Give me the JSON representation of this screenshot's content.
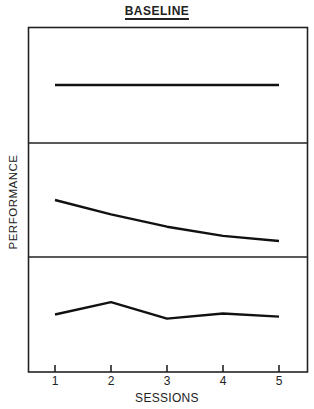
{
  "chart_data": {
    "type": "line",
    "title": "BASELINE",
    "xlabel": "SESSIONS",
    "ylabel": "PERFORMANCE",
    "x": [
      1,
      2,
      3,
      4,
      5
    ],
    "grid": false,
    "legend": null,
    "panels": [
      {
        "name": "top",
        "values": [
          0.5,
          0.5,
          0.5,
          0.5,
          0.5
        ],
        "description": "flat / stable"
      },
      {
        "name": "middle",
        "values": [
          0.5,
          0.36,
          0.24,
          0.15,
          0.1
        ],
        "description": "decreasing"
      },
      {
        "name": "bottom",
        "values": [
          0.5,
          0.62,
          0.46,
          0.51,
          0.48
        ],
        "description": "variable / stable"
      }
    ]
  },
  "labels": {
    "title": "BASELINE",
    "ylabel": "PERFORMANCE",
    "xlabel": "SESSIONS",
    "ticks": [
      "1",
      "2",
      "3",
      "4",
      "5"
    ]
  }
}
